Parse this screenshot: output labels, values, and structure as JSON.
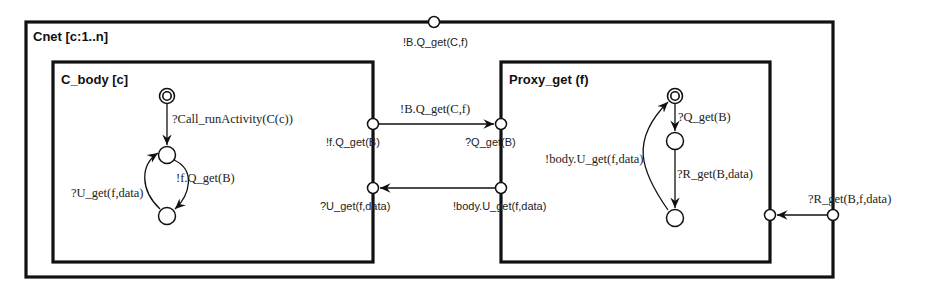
{
  "diagram": {
    "outer": {
      "title": "Cnet [c:1..n]",
      "top_port_label": "!B.Q_get(C,f)",
      "right_port_label": "?R_get(B,f,data)"
    },
    "c_body": {
      "title": "C_body [c]",
      "transitions": {
        "init_to_s1": "?Call_runActivity(C(c))",
        "s1_to_s2": "!f.Q_get(B)",
        "s2_to_s1": "?U_get(f,data)"
      },
      "ports": {
        "out_q": "!f.Q_get(B)",
        "in_u": "?U_get(f,data)"
      }
    },
    "proxy_get": {
      "title": "Proxy_get (f)",
      "transitions": {
        "init_to_s1": "?Q_get(B)",
        "s1_to_s2": "?R_get(B,data)",
        "s2_to_init": "!body.U_get(f,data)"
      },
      "ports": {
        "in_q": "?Q_get(B)",
        "out_u": "!body.U_get(f,data)"
      }
    },
    "connectors": {
      "q_link_label": "!B.Q_get(C,f)"
    },
    "colors": {
      "stroke": "#111111",
      "background": "#ffffff"
    }
  }
}
